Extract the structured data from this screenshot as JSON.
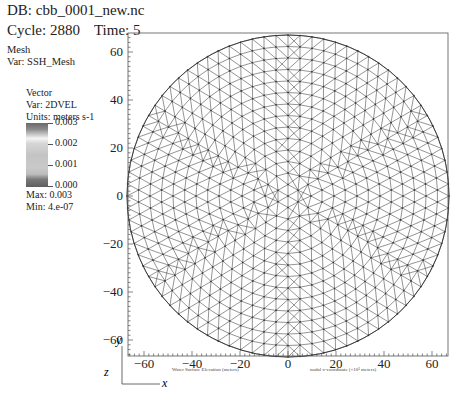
{
  "header": {
    "db_label": "DB: cbb_0001_new.nc",
    "cycle_label": "Cycle: 2880",
    "time_label": "Time: 5"
  },
  "mesh_plot": {
    "title": "Mesh",
    "var_label": "Var: SSH_Mesh"
  },
  "legend": {
    "title": "Vector",
    "var_label": "Var: 2DVEL",
    "units_label": "Units: meters s-1",
    "ticks": [
      "0.003",
      "0.002",
      "0.001",
      "0.000"
    ],
    "max_label": "Max: 0.003",
    "min_label": "Min: 4.e-07"
  },
  "axes": {
    "x_caption": "nodal x-coordinate (×10³ meters)",
    "secondary_caption": "Water Surface Elevation (meters)",
    "triad_y": "y",
    "triad_z": "z",
    "triad_x": "x"
  },
  "chart_data": {
    "type": "mesh",
    "xlabel": "nodal x-coordinate (×10³ meters)",
    "ylabel": "",
    "xlim": [
      -67,
      67
    ],
    "ylim": [
      -67,
      67
    ],
    "x_ticks": [
      -60,
      -40,
      -20,
      0,
      20,
      40,
      60
    ],
    "y_ticks": [
      -60,
      -40,
      -20,
      0,
      20,
      40,
      60
    ],
    "domain_shape": "circle",
    "domain_center": [
      0,
      0
    ],
    "domain_radius": 67,
    "element_type": "triangle",
    "colorbar": {
      "variable": "2DVEL",
      "units": "meters s-1",
      "range": [
        0.0,
        0.003
      ],
      "ticks": [
        0.003,
        0.002,
        0.001,
        0.0
      ],
      "max": 0.003,
      "min": 4e-07
    },
    "grid": false
  }
}
